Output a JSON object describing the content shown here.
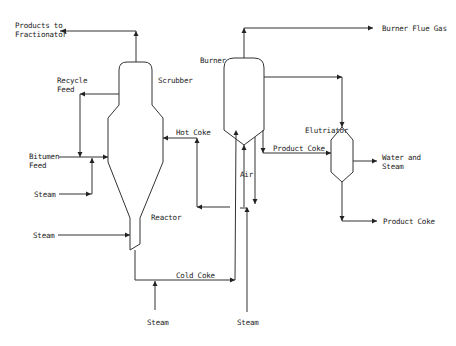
{
  "diagram": {
    "colors": {
      "line": "#333333",
      "text": "#222222",
      "background": "#ffffff"
    },
    "units": {
      "reactor": {
        "label": "Reactor"
      },
      "scrubber": {
        "label": "Scrubber"
      },
      "burner": {
        "label": "Burner"
      },
      "elutriator": {
        "label": "Elutriator"
      }
    },
    "streams": {
      "products_to_fractionator": {
        "line1": "Products to",
        "line2": "Fractionator"
      },
      "recycle_feed": {
        "line1": "Recycle",
        "line2": "Feed"
      },
      "bitumen_feed": {
        "line1": "Bitumen",
        "line2": "Feed"
      },
      "steam_feed": "Steam",
      "steam_reactor": "Steam",
      "hot_coke": "Hot Coke",
      "cold_coke": "Cold Coke",
      "steam_cold_coke": "Steam",
      "steam_burner": "Steam",
      "air": "Air",
      "burner_flue_gas": "Burner Flue Gas",
      "product_coke_to_elutriator": "Product Coke",
      "water_and_steam": {
        "line1": "Water and",
        "line2": "Steam"
      },
      "product_coke_out": "Product Coke"
    }
  }
}
